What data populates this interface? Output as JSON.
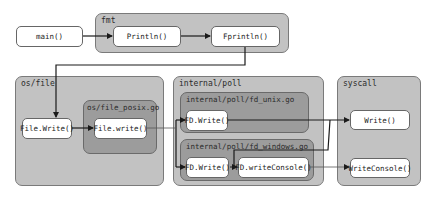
{
  "nodes": {
    "main": "main()",
    "println": "Println()",
    "fprintln": "Fprintln()",
    "file_write_exported": "File.Write()",
    "file_write_internal": "File.write()",
    "fd_write_unix": "FD.Write()",
    "fd_write_windows": "FD.Write()",
    "fd_write_console": "FD.writeConsole()",
    "syscall_write": "Write()",
    "syscall_write_console": "WriteConsole()"
  },
  "groups": {
    "fmt": "fmt",
    "os_file": "os/file",
    "os_file_posix": "os/file_posix.go",
    "internal_poll": "internal/poll",
    "fd_unix": "internal/poll/fd_unix.go",
    "fd_windows": "internal/poll/fd_windows.go",
    "syscall": "syscall"
  },
  "colors": {
    "outer_group": "#c2c2c2",
    "inner_group": "#9c9c9c",
    "node": "#ffffff",
    "edge": "#1a1a1a",
    "edge_light": "#555555"
  },
  "edges": [
    {
      "from": "main()",
      "to": "Println()"
    },
    {
      "from": "Println()",
      "to": "Fprintln()"
    },
    {
      "from": "Fprintln()",
      "to": "File.Write()"
    },
    {
      "from": "File.Write()",
      "to": "File.write()"
    },
    {
      "from": "File.write()",
      "to": "FD.Write() (fd_unix.go)"
    },
    {
      "from": "File.write()",
      "to": "FD.Write() (fd_windows.go)"
    },
    {
      "from": "FD.Write() (fd_unix.go)",
      "to": "Write()"
    },
    {
      "from": "FD.Write() (fd_windows.go)",
      "to": "FD.writeConsole()"
    },
    {
      "from": "FD.Write() (fd_windows.go)",
      "to": "Write()"
    },
    {
      "from": "FD.writeConsole()",
      "to": "WriteConsole()"
    }
  ]
}
